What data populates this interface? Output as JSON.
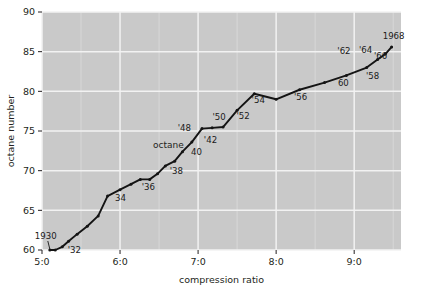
{
  "chart_data": {
    "type": "line",
    "title": "",
    "xlabel": "compression ratio",
    "ylabel": "octane number",
    "xlim": [
      5.0,
      9.6
    ],
    "ylim": [
      60,
      90
    ],
    "grid": true,
    "legend": "none",
    "xtick_labels": [
      "5:0",
      "6:0",
      "7:0",
      "8:0",
      "9:0"
    ],
    "xtick_values": [
      5.0,
      6.0,
      7.0,
      8.0,
      9.0
    ],
    "ytick_labels": [
      "60",
      "65",
      "70",
      "75",
      "80",
      "85",
      "90"
    ],
    "ytick_values": [
      60,
      65,
      70,
      75,
      80,
      85,
      90
    ],
    "annotations": [
      {
        "text": "octane",
        "x": 6.62,
        "y": 72.9
      }
    ],
    "series": [
      {
        "name": "octane number vs compression ratio",
        "x": [
          5.1,
          5.17,
          5.26,
          5.34,
          5.45,
          5.58,
          5.72,
          5.84,
          6.0,
          6.14,
          6.26,
          6.38,
          6.48,
          6.58,
          6.7,
          6.8,
          6.92,
          7.05,
          7.18,
          7.32,
          7.5,
          7.72,
          8.0,
          8.3,
          8.62,
          8.9,
          9.16,
          9.3,
          9.4,
          9.48
        ],
        "y": [
          60.0,
          60.0,
          60.4,
          61.1,
          62.0,
          63.0,
          64.3,
          66.8,
          67.6,
          68.3,
          68.9,
          68.9,
          69.6,
          70.6,
          71.2,
          72.4,
          73.6,
          75.3,
          75.4,
          75.5,
          77.6,
          79.7,
          79.0,
          80.2,
          81.1,
          82.0,
          83.0,
          84.0,
          84.7,
          85.6
        ],
        "point_labels": [
          {
            "label": "1930",
            "x": 5.1,
            "y": 60.0
          },
          {
            "label": "'32",
            "x": 5.26,
            "y": 60.4
          },
          {
            "label": "34",
            "x": 5.84,
            "y": 66.8
          },
          {
            "label": "'36",
            "x": 6.26,
            "y": 68.9
          },
          {
            "label": "'38",
            "x": 6.58,
            "y": 70.6
          },
          {
            "label": "40",
            "x": 6.8,
            "y": 72.4
          },
          {
            "label": "'42",
            "x": 6.92,
            "y": 73.6
          },
          {
            "label": "'48",
            "x": 7.05,
            "y": 75.3
          },
          {
            "label": "'50",
            "x": 7.32,
            "y": 75.5
          },
          {
            "label": "'52",
            "x": 7.5,
            "y": 77.6
          },
          {
            "label": "'54",
            "x": 7.72,
            "y": 79.7
          },
          {
            "label": "'56",
            "x": 8.3,
            "y": 80.2
          },
          {
            "label": "'58",
            "x": 9.16,
            "y": 83.0
          },
          {
            "label": "60",
            "x": 8.9,
            "y": 82.0
          },
          {
            "label": "'62",
            "x": 8.92,
            "y": 84.0
          },
          {
            "label": "'64",
            "x": 9.12,
            "y": 84.1
          },
          {
            "label": "'66",
            "x": 9.3,
            "y": 84.3
          },
          {
            "label": "1968",
            "x": 9.48,
            "y": 85.6
          }
        ]
      }
    ],
    "colors": {
      "plot_background": "#c9c9c9",
      "grid": "#f2f2f2",
      "line": "#141414",
      "text": "#231f20",
      "page_background": "#ffffff"
    }
  }
}
